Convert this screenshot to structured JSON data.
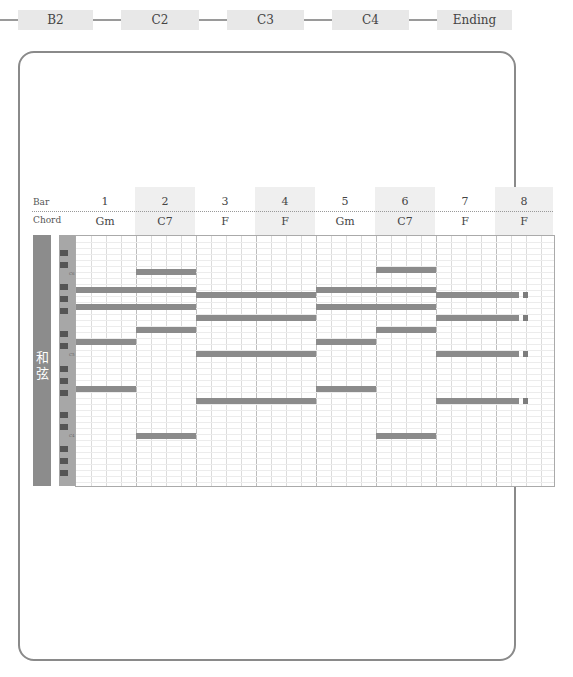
{
  "sections": {
    "items": [
      {
        "label": "B2"
      },
      {
        "label": "C2"
      },
      {
        "label": "C3"
      },
      {
        "label": "C4"
      },
      {
        "label": "Ending"
      }
    ]
  },
  "header": {
    "bar_label": "Bar",
    "chord_label": "Chord",
    "bars": [
      "1",
      "2",
      "3",
      "4",
      "5",
      "6",
      "7",
      "8"
    ],
    "chords": [
      "Gm",
      "C7",
      "F",
      "F",
      "Gm",
      "C7",
      "F",
      "F"
    ]
  },
  "sidebar": {
    "label": "和弦"
  },
  "piano_roll": {
    "colors": {
      "note": "#8b8b8b",
      "grid_line": "#dcdcdc",
      "shade": "#efefef",
      "side": "#8c8c8c"
    },
    "notes": [
      {
        "bar_start": 1,
        "bar_end": 1,
        "y": 289
      },
      {
        "bar_start": 1,
        "bar_end": 1,
        "y": 306
      },
      {
        "bar_start": 1,
        "bar_end": 1,
        "y": 341
      },
      {
        "bar_start": 1,
        "bar_end": 1,
        "y": 388
      },
      {
        "bar_start": 2,
        "bar_end": 2,
        "y": 271
      },
      {
        "bar_start": 2,
        "bar_end": 2,
        "y": 289
      },
      {
        "bar_start": 2,
        "bar_end": 2,
        "y": 306
      },
      {
        "bar_start": 2,
        "bar_end": 2,
        "y": 329
      },
      {
        "bar_start": 2,
        "bar_end": 2,
        "y": 435
      },
      {
        "bar_start": 3,
        "bar_end": 4,
        "y": 294
      },
      {
        "bar_start": 3,
        "bar_end": 4,
        "y": 317
      },
      {
        "bar_start": 3,
        "bar_end": 4,
        "y": 353
      },
      {
        "bar_start": 3,
        "bar_end": 4,
        "y": 400
      },
      {
        "bar_start": 5,
        "bar_end": 5,
        "y": 289
      },
      {
        "bar_start": 5,
        "bar_end": 5,
        "y": 306
      },
      {
        "bar_start": 5,
        "bar_end": 5,
        "y": 341
      },
      {
        "bar_start": 5,
        "bar_end": 5,
        "y": 388
      },
      {
        "bar_start": 6,
        "bar_end": 6,
        "y": 269
      },
      {
        "bar_start": 6,
        "bar_end": 6,
        "y": 289
      },
      {
        "bar_start": 6,
        "bar_end": 6,
        "y": 306
      },
      {
        "bar_start": 6,
        "bar_end": 6,
        "y": 329
      },
      {
        "bar_start": 6,
        "bar_end": 6,
        "y": 435
      },
      {
        "bar_start": 7,
        "bar_end": 8,
        "y": 294
      },
      {
        "bar_start": 7,
        "bar_end": 8,
        "y": 317
      },
      {
        "bar_start": 7,
        "bar_end": 8,
        "y": 353
      },
      {
        "bar_start": 7,
        "bar_end": 8,
        "y": 400
      }
    ]
  }
}
